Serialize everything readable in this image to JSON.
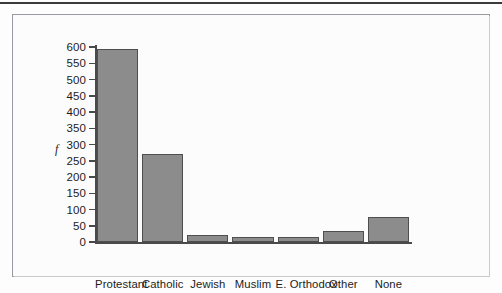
{
  "figure": {
    "bar_color": "#8c8c8c",
    "bar_border_color": "#4f4f4f",
    "axis_color": "#4a4a4a"
  },
  "chart_data": {
    "type": "bar",
    "title": "",
    "xlabel": "Religion",
    "ylabel": "f",
    "categories": [
      "Protestant",
      "Catholic",
      "Jewish",
      "Muslim",
      "E. Orthodox",
      "Other",
      "None"
    ],
    "values": [
      595,
      270,
      23,
      14,
      14,
      35,
      76
    ],
    "ylim": [
      0,
      600
    ],
    "yticks": [
      0,
      50,
      100,
      150,
      200,
      250,
      300,
      350,
      400,
      450,
      500,
      550,
      600
    ],
    "ytick_labels": [
      "0",
      "50",
      "100",
      "150",
      "200",
      "250",
      "300",
      "350",
      "400",
      "450",
      "500",
      "550",
      "600"
    ],
    "grid": false,
    "legend": false
  }
}
